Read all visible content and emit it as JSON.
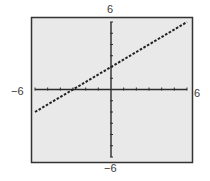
{
  "chart_data": {
    "type": "line",
    "title": "",
    "xlabel": "",
    "ylabel": "",
    "xlim": [
      -6,
      6
    ],
    "ylim": [
      -6,
      6
    ],
    "grid": false,
    "tick_step": 1,
    "window_labels": {
      "ymax": "6",
      "ymin": "−6",
      "xmin": "−6",
      "xmax": "6"
    },
    "series": [
      {
        "name": "y = (2/3)x + 2",
        "equation": "y = (2/3)x + 2",
        "x": [
          -6,
          -3,
          0,
          3,
          6
        ],
        "y": [
          -2,
          0,
          2,
          4,
          6
        ],
        "style": "dotted"
      }
    ]
  },
  "colors": {
    "frame_background": "#e9e9e9",
    "frame_border": "#333333",
    "axis": "#2b2b2b",
    "line": "#222222",
    "label": "#3a3a3a"
  }
}
